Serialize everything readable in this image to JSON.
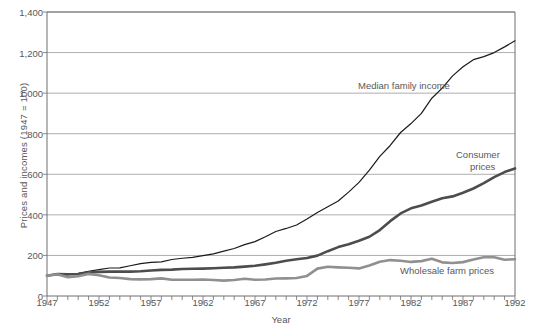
{
  "chart_data": {
    "type": "line",
    "title": "",
    "xlabel": "Year",
    "ylabel": "Prices and incomes (1947 = 100)",
    "xlim": [
      1947,
      1992
    ],
    "ylim": [
      0,
      1400
    ],
    "grid": true,
    "legend_position": "inline-annotations",
    "y_ticks": [
      "0",
      "200",
      "400",
      "600",
      "800",
      "1,000",
      "1,200",
      "1,400"
    ],
    "y_tick_values": [
      0,
      200,
      400,
      600,
      800,
      1000,
      1200,
      1400
    ],
    "x_ticks": [
      "1947",
      "1952",
      "1957",
      "1962",
      "1967",
      "1972",
      "1977",
      "1982",
      "1987",
      "1992"
    ],
    "x_tick_values": [
      1947,
      1952,
      1957,
      1962,
      1967,
      1972,
      1977,
      1982,
      1987,
      1992
    ],
    "x_minor_tick_step": 1,
    "x": [
      1947,
      1948,
      1949,
      1950,
      1951,
      1952,
      1953,
      1954,
      1955,
      1956,
      1957,
      1958,
      1959,
      1960,
      1961,
      1962,
      1963,
      1964,
      1965,
      1966,
      1967,
      1968,
      1969,
      1970,
      1971,
      1972,
      1973,
      1974,
      1975,
      1976,
      1977,
      1978,
      1979,
      1980,
      1981,
      1982,
      1983,
      1984,
      1985,
      1986,
      1987,
      1988,
      1989,
      1990,
      1991,
      1992
    ],
    "series": [
      {
        "name": "Median family income",
        "color": "#1a1a1a",
        "width": 1.2,
        "values": [
          100,
          104,
          104,
          112,
          122,
          130,
          138,
          139,
          149,
          160,
          166,
          168,
          180,
          186,
          190,
          199,
          208,
          221,
          234,
          253,
          268,
          292,
          318,
          333,
          350,
          380,
          412,
          440,
          468,
          512,
          560,
          620,
          688,
          742,
          806,
          850,
          900,
          975,
          1025,
          1085,
          1130,
          1165,
          1180,
          1200,
          1228,
          1258
        ]
      },
      {
        "name": "Consumer prices",
        "color": "#4d4d4d",
        "width": 2.6,
        "values": [
          100,
          108,
          107,
          108,
          116,
          119,
          120,
          120,
          120,
          122,
          126,
          129,
          130,
          133,
          134,
          135,
          137,
          139,
          141,
          145,
          149,
          156,
          164,
          174,
          181,
          187,
          199,
          221,
          241,
          255,
          272,
          292,
          325,
          369,
          407,
          432,
          446,
          465,
          482,
          491,
          509,
          530,
          556,
          586,
          611,
          629
        ]
      },
      {
        "name": "Wholesale farm prices",
        "color": "#909090",
        "width": 2.6,
        "values": [
          100,
          107,
          93,
          97,
          109,
          102,
          91,
          89,
          83,
          82,
          83,
          87,
          80,
          80,
          80,
          81,
          79,
          76,
          79,
          85,
          80,
          81,
          86,
          87,
          89,
          99,
          135,
          144,
          141,
          139,
          136,
          150,
          169,
          177,
          174,
          168,
          172,
          184,
          166,
          163,
          167,
          180,
          191,
          191,
          179,
          181
        ]
      }
    ],
    "annotations": [
      {
        "text": "Median family income",
        "x_px": 358,
        "y_px": 80
      },
      {
        "text": "Consumer",
        "x_px": 456,
        "y_px": 149
      },
      {
        "text": "prices",
        "x_px": 470,
        "y_px": 161
      },
      {
        "text": "Wholesale farm prices",
        "x_px": 400,
        "y_px": 265
      }
    ],
    "colors": {
      "axis": "#6e6e70",
      "grid": "#8a8a8c",
      "text": "#58585a",
      "background": "#ffffff"
    }
  }
}
